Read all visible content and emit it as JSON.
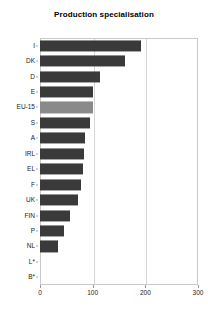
{
  "chart_data": {
    "type": "bar",
    "orientation": "horizontal",
    "title": "Production specialisation",
    "xlabel": "",
    "ylabel": "",
    "categories": [
      "I",
      "DK",
      "D",
      "E",
      "EU-15",
      "S",
      "A",
      "IRL",
      "EL",
      "F",
      "UK",
      "FIN",
      "P",
      "NL",
      "L*",
      "B*"
    ],
    "values": [
      192,
      162,
      113,
      100,
      100,
      94,
      86,
      83,
      81,
      77,
      72,
      57,
      46,
      35,
      0,
      0
    ],
    "xlim": [
      0,
      300
    ],
    "xticks": [
      0,
      100,
      200,
      300
    ],
    "xticklabels": [
      "0",
      "100",
      "200",
      "300"
    ],
    "grid": true,
    "legend": false,
    "highlight_category": "EU-15",
    "colors": {
      "bar": "#3a3a3a",
      "highlight_bar": "#8a8a8a",
      "frame": "#c9c9c9",
      "gridline": "#d5d5d5",
      "text": "#000000"
    }
  }
}
